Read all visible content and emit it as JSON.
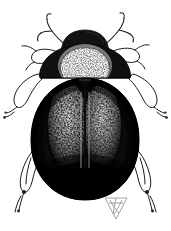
{
  "figure": {
    "kind": "scientific-illustration",
    "technique": "ink-drawing-halftone",
    "view": "dorsal",
    "background_color": "#ffffff",
    "ink_color": "#0d0d0d",
    "highlight_color": "#ffffff",
    "canvas": {
      "width": 171,
      "height": 231
    },
    "title": "",
    "caption": "",
    "label": ""
  },
  "anatomy": {
    "head": {
      "name": "head",
      "shape": "rounded-trapezoid",
      "tone": "dark",
      "center_x": 85,
      "top_y": 30
    },
    "pronotum": {
      "name": "pronotum",
      "shape": "broad-transverse",
      "tone": "dark-with-pale-median-patch",
      "patch": "large-white-rounded-disc",
      "top_y": 46,
      "bottom_y": 78
    },
    "elytra": {
      "name": "elytra",
      "shape": "broad-oval",
      "tone": "black-with-stippled-pale-bands",
      "suture": "median-longitudinal-line",
      "top_y": 78,
      "bottom_y": 200,
      "left_x": 32,
      "right_x": 139
    },
    "antennae": {
      "name": "antennae",
      "count": 2,
      "form": "thin-curved-clubbed",
      "tone": "fine-outline"
    },
    "legs": {
      "name": "legs",
      "count": 6,
      "pairs": [
        "fore-legs",
        "mid-legs",
        "hind-legs"
      ],
      "form": "pale-outlined-with-dark-tarsi",
      "tone": "outline"
    }
  },
  "monogram": {
    "name": "artist-monogram",
    "shape": "triangle-with-interior-lines",
    "x": 105,
    "y": 197,
    "width": 22,
    "height": 22,
    "tone": "faint-grey"
  }
}
